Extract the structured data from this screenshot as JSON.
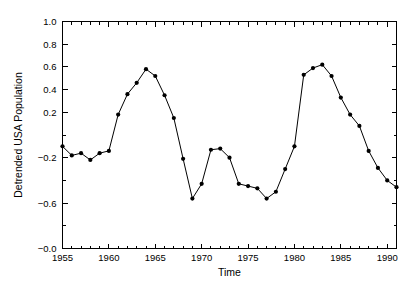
{
  "chart_data": {
    "type": "line",
    "title": "",
    "xlabel": "Time",
    "ylabel": "Detrended USA Population",
    "xlim": [
      1955,
      1991
    ],
    "ylim": [
      -1.0,
      1.0
    ],
    "grid": false,
    "legend": "none",
    "marker": "filled-circle",
    "line_color": "#000000",
    "marker_color": "#000000",
    "xticks": [
      1955,
      1960,
      1965,
      1970,
      1975,
      1980,
      1985,
      1990
    ],
    "xtick_labels": [
      "1955",
      "1960",
      "1965",
      "1970",
      "1975",
      "1980",
      "1985",
      "1990"
    ],
    "xminor_interval": 1,
    "yticks": [
      -1.0,
      -0.8,
      -0.6,
      -0.4,
      -0.2,
      0.0,
      0.2,
      0.4,
      0.6,
      0.8,
      1.0
    ],
    "ytick_labels": [
      "-1.0",
      "",
      "-0.6",
      "",
      "-0.2",
      "",
      "0.2",
      "0.4",
      "0.6",
      "0.8",
      "1.0"
    ],
    "ylabeled_ticks": [
      -1.0,
      -0.6,
      -0.2,
      0.2,
      0.4,
      0.6,
      0.8,
      1.0
    ],
    "x": [
      1955,
      1956,
      1957,
      1958,
      1959,
      1960,
      1961,
      1962,
      1963,
      1964,
      1965,
      1966,
      1967,
      1968,
      1969,
      1970,
      1971,
      1972,
      1973,
      1974,
      1975,
      1976,
      1977,
      1978,
      1979,
      1980,
      1981,
      1982,
      1983,
      1984,
      1985,
      1986,
      1987,
      1988,
      1989,
      1990,
      1991
    ],
    "y": [
      -0.1,
      -0.18,
      -0.16,
      -0.22,
      -0.16,
      -0.14,
      0.18,
      0.36,
      0.46,
      0.58,
      0.52,
      0.35,
      0.15,
      -0.21,
      -0.56,
      -0.43,
      -0.13,
      -0.12,
      -0.2,
      -0.43,
      -0.45,
      -0.47,
      -0.56,
      -0.5,
      -0.3,
      -0.1,
      0.53,
      0.59,
      0.62,
      0.52,
      0.33,
      0.18,
      0.08,
      -0.14,
      -0.29,
      -0.4,
      -0.46
    ],
    "series": [
      {
        "name": "Detrended USA Population",
        "values": [
          -0.1,
          -0.18,
          -0.16,
          -0.22,
          -0.16,
          -0.14,
          0.18,
          0.36,
          0.46,
          0.58,
          0.52,
          0.35,
          0.15,
          -0.21,
          -0.56,
          -0.43,
          -0.13,
          -0.12,
          -0.2,
          -0.43,
          -0.45,
          -0.47,
          -0.56,
          -0.5,
          -0.3,
          -0.1,
          0.53,
          0.59,
          0.62,
          0.52,
          0.33,
          0.18,
          0.08,
          -0.14,
          -0.29,
          -0.4,
          -0.46
        ]
      }
    ]
  },
  "axes": {
    "x_title": "Time",
    "y_title": "Detrended USA Population"
  }
}
